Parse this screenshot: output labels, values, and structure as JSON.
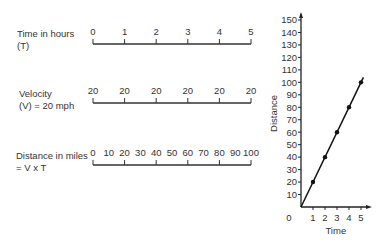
{
  "rows": [
    {
      "label_line1": "Time in hours",
      "label_line2": "(T)",
      "ticks": [
        "0",
        "1",
        "2",
        "3",
        "4",
        "5"
      ]
    },
    {
      "label_line1": "Velocity",
      "label_line2": "(V) = 20 mph",
      "ticks": [
        "20",
        "20",
        "20",
        "20",
        "20",
        "20"
      ]
    },
    {
      "label_line1": "Distance in miles",
      "label_line2": "= V x T",
      "ticks": [
        "0",
        "10",
        "20",
        "30",
        "40",
        "50",
        "60",
        "70",
        "80",
        "90",
        "100"
      ]
    }
  ],
  "chart_data": {
    "type": "line",
    "title": "",
    "xlabel": "Time",
    "ylabel": "Distance",
    "x": [
      0,
      1,
      2,
      3,
      4,
      5
    ],
    "series": [
      {
        "name": "Distance",
        "values": [
          0,
          20,
          40,
          60,
          80,
          100
        ]
      }
    ],
    "x_ticks": [
      "0",
      "1",
      "2",
      "3",
      "4",
      "5"
    ],
    "y_ticks": [
      "10",
      "20",
      "30",
      "40",
      "50",
      "60",
      "70",
      "80",
      "90",
      "100",
      "110",
      "120",
      "130",
      "140",
      "150"
    ],
    "xlim": [
      0,
      5
    ],
    "ylim": [
      0,
      150
    ],
    "markers": [
      [
        1,
        20
      ],
      [
        2,
        40
      ],
      [
        3,
        60
      ],
      [
        4,
        80
      ],
      [
        5,
        100
      ]
    ],
    "grid": false
  }
}
